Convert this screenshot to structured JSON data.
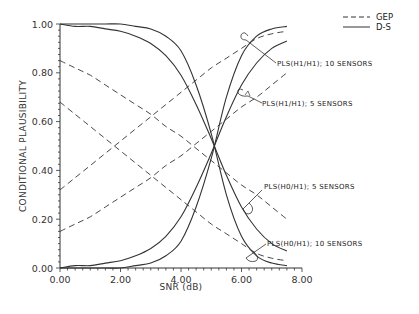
{
  "chart_data": {
    "type": "line",
    "title": "",
    "xlabel": "SNR (dB)",
    "ylabel": "CONDITIONAL PLAUSIBILITY",
    "xlim": [
      0,
      8
    ],
    "ylim": [
      0,
      1
    ],
    "x_ticks": [
      "0.00",
      "2.00",
      "4.00",
      "6.00",
      "8.00"
    ],
    "y_ticks": [
      "0.00",
      "0.20",
      "0.40",
      "0.60",
      "0.80",
      "1.00"
    ],
    "grid": false,
    "legend": {
      "position": "top-right",
      "entries": [
        {
          "label": "GEP",
          "style": "dashed"
        },
        {
          "label": "D-S",
          "style": "solid"
        }
      ]
    },
    "x": [
      0,
      0.5,
      1,
      1.5,
      2,
      2.5,
      3,
      3.5,
      4,
      4.5,
      5,
      5.5,
      6,
      6.5,
      7,
      7.5
    ],
    "series": [
      {
        "name": "GEP PLS(H1/H1); 10 SENSORS",
        "style": "dashed",
        "values": [
          0.32,
          0.37,
          0.42,
          0.47,
          0.52,
          0.57,
          0.62,
          0.67,
          0.72,
          0.77,
          0.82,
          0.86,
          0.9,
          0.94,
          0.96,
          0.97
        ]
      },
      {
        "name": "GEP PLS(H1/H1); 5 SENSORS",
        "style": "dashed",
        "values": [
          0.15,
          0.18,
          0.21,
          0.25,
          0.29,
          0.33,
          0.37,
          0.42,
          0.46,
          0.51,
          0.56,
          0.61,
          0.66,
          0.7,
          0.75,
          0.8
        ]
      },
      {
        "name": "GEP PLS(H0/H1); 5 SENSORS",
        "style": "dashed",
        "values": [
          0.85,
          0.82,
          0.79,
          0.75,
          0.71,
          0.67,
          0.63,
          0.58,
          0.54,
          0.49,
          0.44,
          0.39,
          0.34,
          0.3,
          0.25,
          0.2
        ]
      },
      {
        "name": "GEP PLS(H0/H1); 10 SENSORS",
        "style": "dashed",
        "values": [
          0.68,
          0.63,
          0.58,
          0.53,
          0.48,
          0.43,
          0.38,
          0.33,
          0.28,
          0.23,
          0.18,
          0.14,
          0.1,
          0.06,
          0.04,
          0.03
        ]
      },
      {
        "name": "D-S PLS(H1/H1); 10 SENSORS",
        "style": "solid",
        "values": [
          0.0,
          0.0,
          0.0,
          0.0,
          0.0,
          0.01,
          0.02,
          0.05,
          0.11,
          0.25,
          0.45,
          0.7,
          0.87,
          0.95,
          0.98,
          0.99
        ]
      },
      {
        "name": "D-S PLS(H1/H1); 5 SENSORS",
        "style": "solid",
        "values": [
          0.0,
          0.01,
          0.01,
          0.02,
          0.03,
          0.05,
          0.08,
          0.13,
          0.21,
          0.33,
          0.47,
          0.62,
          0.75,
          0.84,
          0.9,
          0.93
        ]
      },
      {
        "name": "D-S PLS(H0/H1); 5 SENSORS",
        "style": "solid",
        "values": [
          1.0,
          0.99,
          0.99,
          0.98,
          0.97,
          0.95,
          0.92,
          0.87,
          0.79,
          0.67,
          0.53,
          0.38,
          0.25,
          0.16,
          0.1,
          0.07
        ]
      },
      {
        "name": "D-S PLS(H0/H1); 10 SENSORS",
        "style": "solid",
        "values": [
          1.0,
          1.0,
          1.0,
          1.0,
          1.0,
          0.99,
          0.98,
          0.95,
          0.89,
          0.75,
          0.55,
          0.3,
          0.13,
          0.05,
          0.02,
          0.01
        ]
      }
    ],
    "annotations": [
      {
        "text": "PLS(H1/H1); 10 SENSORS",
        "x": 6.3,
        "y": 0.95
      },
      {
        "text": "PLS(H1/H1); 5 SENSORS",
        "x": 6.1,
        "y": 0.78
      },
      {
        "text": "PLS(H0/H1); 5 SENSORS",
        "x": 6.4,
        "y": 0.28
      },
      {
        "text": "PLS(H0/H1); 10 SENSORS",
        "x": 6.3,
        "y": 0.06
      }
    ],
    "crossover": {
      "x": 5.15,
      "y": 0.5
    }
  },
  "labels": {
    "xlabel": "SNR (dB)",
    "ylabel": "CONDITIONAL  PLAUSIBILITY",
    "legend_gep": "GEP",
    "legend_ds": "D-S",
    "annot_1": "PLS(H1/H1); 10 SENSORS",
    "annot_2": "PLS(H1/H1); 5 SENSORS",
    "annot_3": "PLS(H0/H1); 5 SENSORS",
    "annot_4": "PLS(H0/H1); 10 SENSORS",
    "x_ticks": [
      "0.00",
      "2.00",
      "4.00",
      "6.00",
      "8.00"
    ],
    "y_ticks": [
      "0.00",
      "0.20",
      "0.40",
      "0.60",
      "0.80",
      "1.00"
    ]
  },
  "colors": {
    "line": "#333333",
    "text": "#222222",
    "background": "#ffffff"
  }
}
